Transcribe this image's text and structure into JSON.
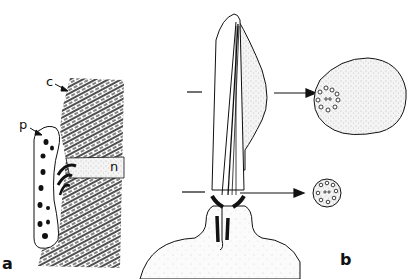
{
  "figure": {
    "panels": [
      {
        "id": "a",
        "label": "a",
        "annotations": [
          {
            "id": "c",
            "text": "c"
          },
          {
            "id": "p",
            "text": "p"
          },
          {
            "id": "n",
            "text": "n"
          }
        ]
      },
      {
        "id": "b",
        "label": "b",
        "cross_sections": [
          {
            "id": "upper-section",
            "description": "large oval cross-section with ring of small circles"
          },
          {
            "id": "lower-section",
            "description": "small round cross-section with ring of small circles"
          }
        ]
      }
    ],
    "colors": {
      "ink": "#111111",
      "stipple": "#9a9a9a",
      "background": "#ffffff"
    }
  }
}
